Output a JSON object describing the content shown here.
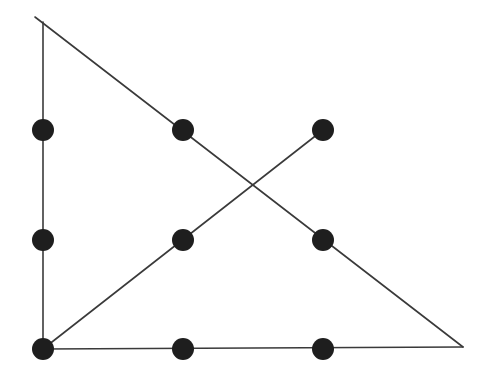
{
  "diagram": {
    "colors": {
      "background": "#ffffff",
      "line": "#3a3a3a",
      "dot": "#1e1e1e"
    },
    "dot_radius": 11,
    "dots": [
      {
        "id": "r1c1",
        "x": 43,
        "y": 130
      },
      {
        "id": "r1c2",
        "x": 183,
        "y": 130
      },
      {
        "id": "r1c3",
        "x": 323,
        "y": 130
      },
      {
        "id": "r2c1",
        "x": 43,
        "y": 240
      },
      {
        "id": "r2c2",
        "x": 183,
        "y": 240
      },
      {
        "id": "r2c3",
        "x": 323,
        "y": 240
      },
      {
        "id": "r3c1",
        "x": 43,
        "y": 349
      },
      {
        "id": "r3c2",
        "x": 183,
        "y": 349
      },
      {
        "id": "r3c3",
        "x": 323,
        "y": 349
      }
    ],
    "segments": [
      {
        "id": "vertical-left",
        "x1": 43,
        "y1": 22,
        "x2": 43,
        "y2": 349
      },
      {
        "id": "bottom-horizontal",
        "x1": 43,
        "y1": 349,
        "x2": 463,
        "y2": 347
      },
      {
        "id": "long-diagonal",
        "x1": 35,
        "y1": 17,
        "x2": 463,
        "y2": 347
      },
      {
        "id": "rising-diagonal",
        "x1": 43,
        "y1": 349,
        "x2": 323,
        "y2": 130
      }
    ]
  }
}
